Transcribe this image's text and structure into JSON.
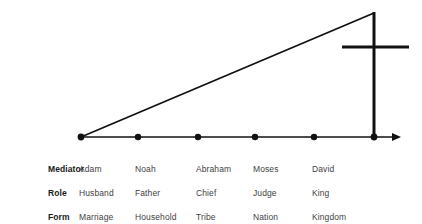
{
  "figure": {
    "background_color": "#ffffff",
    "line_color": "#111111",
    "text_color": "#3f3f3f",
    "label_color": "#1a1a1a"
  },
  "diagram": {
    "axis_name": "timeline-axis",
    "diagonal_name": "ascending-line",
    "cross_name": "cross-symbol",
    "arrowhead_name": "axis-arrowhead",
    "point_count": 6,
    "points": [
      {
        "name": "point-adam",
        "x": 81,
        "y": 137
      },
      {
        "name": "point-noah",
        "x": 138,
        "y": 137
      },
      {
        "name": "point-abraham",
        "x": 198,
        "y": 137
      },
      {
        "name": "point-moses",
        "x": 255,
        "y": 137
      },
      {
        "name": "point-david",
        "x": 314,
        "y": 137
      },
      {
        "name": "point-cross",
        "x": 374,
        "y": 137
      }
    ],
    "axis": {
      "x1": 81,
      "y1": 137,
      "x2": 401,
      "y2": 137
    },
    "diagonal": {
      "x1": 81,
      "y1": 137,
      "x2": 374,
      "y2": 13
    },
    "cross": {
      "post_x": 374,
      "post_top_y": 12,
      "post_bottom_y": 138,
      "bar_y": 47,
      "bar_x1": 342,
      "bar_x2": 409
    }
  },
  "table": {
    "row_labels": [
      "Mediator",
      "Role",
      "Form"
    ],
    "rows": [
      {
        "label": "Mediator",
        "cells": [
          "Adam",
          "Noah",
          "Abraham",
          "Moses",
          "David"
        ]
      },
      {
        "label": "Role",
        "cells": [
          "Husband",
          "Father",
          "Chief",
          "Judge",
          "King"
        ]
      },
      {
        "label": "Form",
        "cells": [
          "Marriage",
          "Household",
          "Tribe",
          "Nation",
          "Kingdom"
        ]
      }
    ]
  }
}
